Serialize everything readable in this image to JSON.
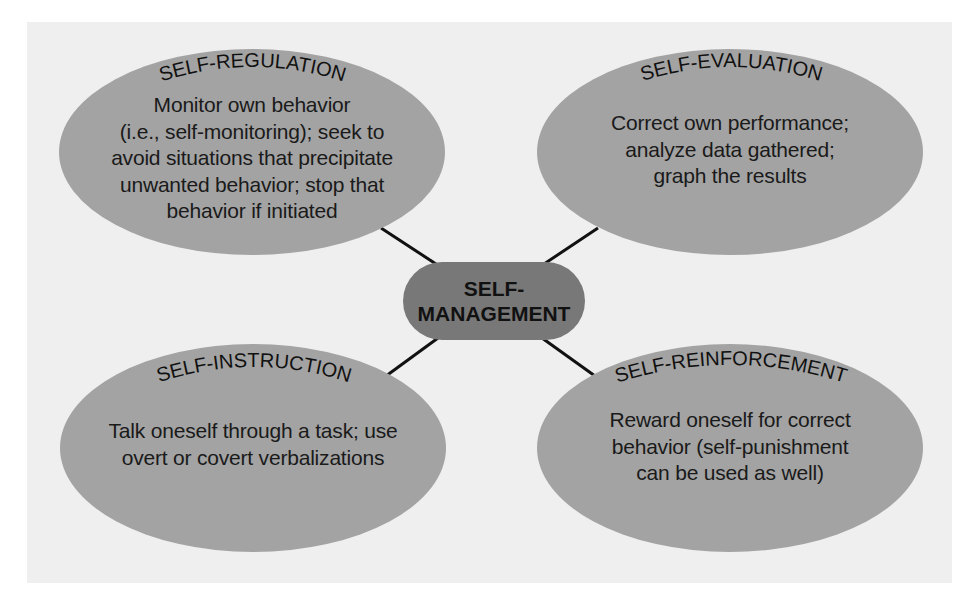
{
  "diagram": {
    "type": "concept-map",
    "colors": {
      "background": "#ffffff",
      "panel": "#efefef",
      "node_fill": "#a3a3a3",
      "center_fill": "#787878",
      "connector": "#111111",
      "text": "#1a1a1a"
    },
    "center": {
      "line1": "SELF-",
      "line2": "MANAGEMENT"
    },
    "nodes": [
      {
        "id": "self-regulation",
        "position": "top-left",
        "title": "SELF-REGULATION",
        "lines": [
          "Monitor own behavior",
          "(i.e., self-monitoring); seek to",
          "avoid situations that precipitate",
          "unwanted behavior; stop that",
          "behavior if initiated"
        ]
      },
      {
        "id": "self-evaluation",
        "position": "top-right",
        "title": "SELF-EVALUATION",
        "lines": [
          "Correct own performance;",
          "analyze data gathered;",
          "graph the results"
        ]
      },
      {
        "id": "self-instruction",
        "position": "bottom-left",
        "title": "SELF-INSTRUCTION",
        "lines": [
          "Talk oneself through a task; use",
          "overt or covert verbalizations"
        ]
      },
      {
        "id": "self-reinforcement",
        "position": "bottom-right",
        "title": "SELF-REINFORCEMENT",
        "lines": [
          "Reward oneself for correct",
          "behavior (self-punishment",
          "can be used as well)"
        ]
      }
    ]
  }
}
